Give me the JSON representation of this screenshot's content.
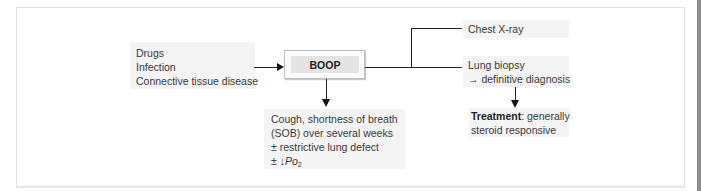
{
  "diagram": {
    "central_node": "BOOP",
    "causes": [
      "Drugs",
      "Infection",
      "Connective tissue disease"
    ],
    "investigations": {
      "chest_xray": "Chest X-ray",
      "lung_biopsy": "Lung biopsy",
      "lung_biopsy_result": "→ definitive diagnosis"
    },
    "presentation": {
      "line1": "Cough, shortness of breath",
      "line2": "(SOB) over several weeks",
      "line3": "± restrictive lung defect",
      "line4_prefix": "± ",
      "line4_arrow": "↓",
      "line4_var": "Po",
      "line4_sub": "2"
    },
    "treatment": {
      "label": "Treatment",
      "text_after_label": ": generally",
      "line2": "steroid responsive"
    }
  },
  "colors": {
    "box_fill": "#f4f4f4",
    "node_fill": "#e4e4e4",
    "connector": "#222222"
  }
}
